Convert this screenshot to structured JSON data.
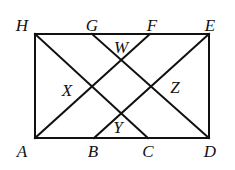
{
  "diagram": {
    "type": "geometry",
    "stroke_color": "#111111",
    "points": {
      "H": {
        "x": 35,
        "y": 34,
        "lx": 22,
        "ly": 25
      },
      "G": {
        "x": 92,
        "y": 34,
        "lx": 92,
        "ly": 25
      },
      "F": {
        "x": 150,
        "y": 34,
        "lx": 152,
        "ly": 25
      },
      "E": {
        "x": 209,
        "y": 34,
        "lx": 210,
        "ly": 25
      },
      "A": {
        "x": 35,
        "y": 138,
        "lx": 22,
        "ly": 151
      },
      "B": {
        "x": 94,
        "y": 138,
        "lx": 93,
        "ly": 151
      },
      "C": {
        "x": 148,
        "y": 138,
        "lx": 148,
        "ly": 151
      },
      "D": {
        "x": 209,
        "y": 138,
        "lx": 210,
        "ly": 151
      }
    },
    "interior_labels": [
      {
        "name": "W",
        "x": 121,
        "y": 47
      },
      {
        "name": "X",
        "x": 67,
        "y": 90
      },
      {
        "name": "Z",
        "x": 175,
        "y": 87
      },
      {
        "name": "Y",
        "x": 118,
        "y": 127
      }
    ],
    "segments": [
      [
        "H",
        "E"
      ],
      [
        "E",
        "D"
      ],
      [
        "D",
        "A"
      ],
      [
        "A",
        "H"
      ],
      [
        "H",
        "C"
      ],
      [
        "G",
        "D"
      ],
      [
        "A",
        "F"
      ],
      [
        "B",
        "E"
      ]
    ]
  }
}
